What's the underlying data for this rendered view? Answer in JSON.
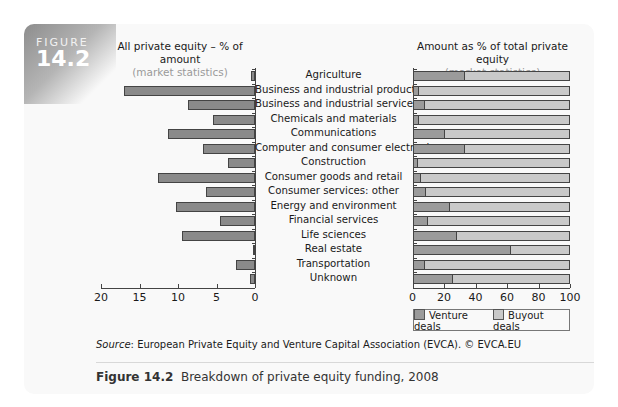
{
  "figure": {
    "badge_word": "FIGURE",
    "badge_number": "14.2",
    "source_label": "Source",
    "source_text": ": European Private Equity and Venture Capital Association (EVCA). © EVCA.EU",
    "caption_label": "Figure 14.2",
    "caption_text": "Breakdown of private equity funding, 2008"
  },
  "left_chart": {
    "title": "All private equity – % of amount",
    "subtitle": "(market statistics)",
    "ticks": [
      "20",
      "15",
      "10",
      "5",
      "0"
    ]
  },
  "right_chart": {
    "title": "Amount as % of total private equity",
    "subtitle": "(market statistics)",
    "ticks": [
      "0",
      "20",
      "40",
      "60",
      "80",
      "100"
    ],
    "legend": [
      "Venture deals",
      "Buyout deals"
    ]
  },
  "colors": {
    "left_bar": "#8a8a8a",
    "venture": "#9b9b9b",
    "buyout": "#c9c9c9"
  },
  "chart_data": [
    {
      "type": "bar",
      "orientation": "horizontal",
      "title": "All private equity – % of amount",
      "subtitle": "(market statistics)",
      "xlabel": "",
      "ylabel": "",
      "xlim": [
        20,
        0
      ],
      "x_reversed": true,
      "categories": [
        "Agriculture",
        "Business and industrial products",
        "Business and industrial services",
        "Chemicals and materials",
        "Communications",
        "Computer and consumer electronics",
        "Construction",
        "Consumer goods and retail",
        "Consumer services: other",
        "Energy and environment",
        "Financial services",
        "Life sciences",
        "Real estate",
        "Transportation",
        "Unknown"
      ],
      "values": [
        0.5,
        17.0,
        8.7,
        5.5,
        11.3,
        6.8,
        3.5,
        12.6,
        6.4,
        10.3,
        4.5,
        9.5,
        0.3,
        2.5,
        0.7
      ],
      "grid": false
    },
    {
      "type": "bar",
      "orientation": "horizontal",
      "stacked": true,
      "title": "Amount as % of total private equity",
      "subtitle": "(market statistics)",
      "xlim": [
        0,
        100
      ],
      "categories": [
        "Agriculture",
        "Business and industrial products",
        "Business and industrial services",
        "Chemicals and materials",
        "Communications",
        "Computer and consumer electronics",
        "Construction",
        "Consumer goods and retail",
        "Consumer services: other",
        "Energy and environment",
        "Financial services",
        "Life sciences",
        "Real estate",
        "Transportation",
        "Unknown"
      ],
      "series": [
        {
          "name": "Venture deals",
          "values": [
            33,
            3.5,
            7,
            3.5,
            20,
            33,
            3,
            5,
            8,
            23,
            9,
            27.5,
            62,
            7,
            25
          ]
        },
        {
          "name": "Buyout deals",
          "values": [
            67,
            96.5,
            93,
            96.5,
            80,
            67,
            97,
            95,
            92,
            77,
            91,
            72.5,
            38,
            93,
            75
          ]
        }
      ],
      "legend_position": "bottom-right",
      "grid": false
    }
  ]
}
